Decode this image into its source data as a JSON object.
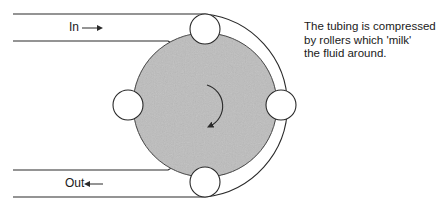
{
  "diagram": {
    "labels": {
      "in": "In",
      "out": "Out"
    },
    "caption_lines": [
      "The tubing is compressed",
      "by rollers which 'milk'",
      "the fluid around."
    ],
    "colors": {
      "line": "#2a2a2a",
      "rotor_fill": "#bdbdbd",
      "roller_fill": "#ffffff",
      "background": "#ffffff"
    },
    "rotor": {
      "cx": 205,
      "cy": 105,
      "r": 72,
      "rotation": "clockwise"
    },
    "rollers": [
      {
        "name": "top",
        "cx": 205,
        "cy": 29,
        "r": 15
      },
      {
        "name": "right",
        "cx": 281,
        "cy": 105,
        "r": 15
      },
      {
        "name": "bottom",
        "cx": 205,
        "cy": 182,
        "r": 15
      },
      {
        "name": "left",
        "cx": 128,
        "cy": 105,
        "r": 15
      }
    ],
    "tubes": {
      "inlet": {
        "y_top": 14,
        "y_bottom": 41,
        "x_start": 13
      },
      "outlet": {
        "y_top": 170,
        "y_bottom": 197,
        "x_start": 13
      }
    }
  }
}
